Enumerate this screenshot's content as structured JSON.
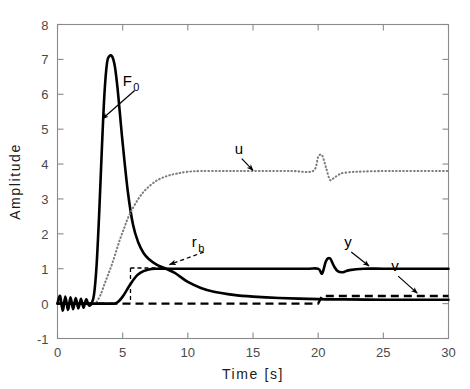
{
  "chart_data": {
    "type": "line",
    "title": "",
    "xlabel": "Time  [s]",
    "ylabel": "Amplitude",
    "xlim": [
      0,
      30
    ],
    "ylim": [
      -1,
      8
    ],
    "xticks": [
      0,
      5,
      10,
      15,
      20,
      25,
      30
    ],
    "xtick_labels": [
      "0",
      "5",
      "10",
      "15",
      "20",
      "25",
      "30"
    ],
    "yticks": [
      -1,
      0,
      1,
      2,
      3,
      4,
      5,
      6,
      7,
      8
    ],
    "ytick_labels": [
      "-1",
      "0",
      "1",
      "2",
      "3",
      "4",
      "5",
      "6",
      "7",
      "8"
    ],
    "grid": false,
    "legend": "none (curves labelled inline with arrows)",
    "series": [
      {
        "name": "F_0",
        "style": "solid",
        "color": "#000000",
        "description": "control force: small noisy oscillation near 0 until t=2.5, sharp rise to peak 7.1 at t=4.3, rapid decay crossing 1.0 near t=9, settles near 0.1",
        "x": [
          0.0,
          0.2,
          0.4,
          0.6,
          0.8,
          1.0,
          1.2,
          1.4,
          1.6,
          1.8,
          2.0,
          2.2,
          2.4,
          2.6,
          2.8,
          3.0,
          3.2,
          3.4,
          3.6,
          3.8,
          4.0,
          4.2,
          4.4,
          4.6,
          4.8,
          5.0,
          5.4,
          5.8,
          6.2,
          6.6,
          7.0,
          7.6,
          8.2,
          9.0,
          10.0,
          11.0,
          12.0,
          13.5,
          15.0,
          17.0,
          20.0,
          22.0,
          25.0,
          27.5,
          30.0
        ],
        "y": [
          0.0,
          0.22,
          -0.2,
          0.2,
          -0.18,
          0.18,
          -0.16,
          0.16,
          -0.14,
          0.14,
          -0.12,
          0.12,
          -0.05,
          0.0,
          0.25,
          1.1,
          2.6,
          4.4,
          6.0,
          6.9,
          7.1,
          7.08,
          6.8,
          6.2,
          5.4,
          4.6,
          3.2,
          2.25,
          1.75,
          1.45,
          1.28,
          1.12,
          1.02,
          0.88,
          0.62,
          0.45,
          0.34,
          0.25,
          0.2,
          0.16,
          0.13,
          0.12,
          0.11,
          0.11,
          0.11
        ]
      },
      {
        "name": "u",
        "style": "dotted",
        "color": "#7d7d7d",
        "description": "control input: rises from 0 at t=3 through 1.0 at t=4.5 up to plateau 3.8 by t=9, brief spike up to 4.25 then dip to 3.55 around t=20-21, returns to 3.8",
        "x": [
          3.0,
          3.3,
          3.6,
          3.9,
          4.2,
          4.5,
          4.8,
          5.1,
          5.4,
          5.8,
          6.2,
          6.6,
          7.0,
          7.5,
          8.0,
          8.6,
          9.2,
          10.0,
          11.0,
          12.5,
          14.0,
          16.0,
          18.0,
          19.6,
          20.0,
          20.3,
          20.6,
          20.9,
          21.2,
          21.6,
          22.0,
          23.0,
          25.0,
          27.0,
          30.0
        ],
        "y": [
          0.05,
          0.25,
          0.55,
          0.85,
          1.15,
          1.5,
          1.85,
          2.15,
          2.45,
          2.75,
          3.0,
          3.2,
          3.35,
          3.5,
          3.6,
          3.68,
          3.73,
          3.78,
          3.8,
          3.8,
          3.8,
          3.8,
          3.8,
          3.8,
          4.2,
          4.25,
          3.9,
          3.55,
          3.6,
          3.7,
          3.75,
          3.78,
          3.8,
          3.8,
          3.8
        ]
      },
      {
        "name": "y",
        "style": "solid",
        "color": "#000000",
        "description": "output: flat 0 until t=4.4, smooth S-rise to 1.0 by t=7, holds 1.0, small dip-overshoot disturbance at t=20.3-21.5, back to 1.0",
        "x": [
          0.0,
          2.0,
          4.0,
          4.4,
          4.7,
          5.0,
          5.3,
          5.6,
          5.9,
          6.2,
          6.6,
          7.0,
          7.5,
          8.5,
          10.0,
          13.0,
          16.0,
          19.0,
          20.0,
          20.3,
          20.6,
          20.9,
          21.2,
          21.5,
          21.9,
          22.4,
          23.5,
          25.0,
          27.0,
          30.0
        ],
        "y": [
          0.0,
          0.0,
          0.0,
          0.0,
          0.07,
          0.2,
          0.38,
          0.56,
          0.72,
          0.84,
          0.93,
          0.98,
          1.0,
          1.0,
          1.0,
          1.0,
          1.0,
          1.0,
          1.0,
          0.86,
          1.22,
          1.3,
          1.08,
          0.93,
          0.9,
          0.96,
          1.0,
          1.0,
          1.0,
          1.0
        ]
      },
      {
        "name": "v",
        "style": "dashed",
        "color": "#000000",
        "description": "disturbance: zero from t=0 to t=20, steps up to 0.22 and stays constant to t=30",
        "x": [
          0.0,
          19.6,
          20.0,
          20.3,
          21.0,
          25.0,
          30.0
        ],
        "y": [
          0.0,
          0.0,
          0.0,
          0.22,
          0.22,
          0.22,
          0.22
        ]
      }
    ],
    "annotations": [
      {
        "name": "F_0",
        "text": "F",
        "subscript": "0",
        "label_x": 5.0,
        "label_y": 6.25,
        "points_to_x": 3.45,
        "points_to_y": 5.3
      },
      {
        "name": "u",
        "text": "u",
        "subscript": "",
        "label_x": 13.6,
        "label_y": 4.3,
        "points_to_x": 15.0,
        "points_to_y": 3.82
      },
      {
        "name": "r_b",
        "text": "r",
        "subscript": "b",
        "label_x": 10.3,
        "label_y": 1.62,
        "points_to_x": 8.6,
        "points_to_y": 1.12
      },
      {
        "name": "y",
        "text": "y",
        "subscript": "",
        "label_x": 22.0,
        "label_y": 1.62,
        "points_to_x": 23.9,
        "points_to_y": 1.08
      },
      {
        "name": "v",
        "text": "v",
        "subscript": "",
        "label_x": 25.6,
        "label_y": 0.93,
        "points_to_x": 27.6,
        "points_to_y": 0.3
      }
    ]
  }
}
